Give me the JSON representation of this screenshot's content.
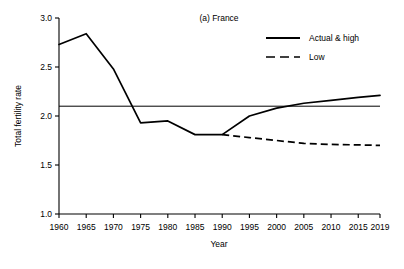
{
  "chart_data": {
    "type": "line",
    "title": "(a) France",
    "xlabel": "Year",
    "ylabel": "Total fertility rate",
    "xlim": [
      1960,
      2019
    ],
    "ylim": [
      1.0,
      3.0
    ],
    "yticks": [
      "1.0",
      "1.5",
      "2.0",
      "2.5",
      "3.0"
    ],
    "ytick_values": [
      1.0,
      1.5,
      2.0,
      2.5,
      3.0
    ],
    "xticks": [
      "1960",
      "1965",
      "1970",
      "1975",
      "1980",
      "1985",
      "1990",
      "1995",
      "2000",
      "2005",
      "2010",
      "2015",
      "2019"
    ],
    "xtick_values": [
      1960,
      1965,
      1970,
      1975,
      1980,
      1985,
      1990,
      1995,
      2000,
      2005,
      2010,
      2015,
      2019
    ],
    "grid": false,
    "legend_position": "top-right",
    "reference_line": {
      "name": "replacement-level",
      "y": 2.1,
      "style": "solid",
      "color": "#000000"
    },
    "series": [
      {
        "name": "Actual & high",
        "style": "solid",
        "color": "#000000",
        "x": [
          1960,
          1965,
          1970,
          1975,
          1980,
          1985,
          1990,
          1995,
          2000,
          2005,
          2010,
          2015,
          2019
        ],
        "values": [
          2.73,
          2.84,
          2.48,
          1.93,
          1.95,
          1.81,
          1.81,
          2.0,
          2.08,
          2.13,
          2.16,
          2.19,
          2.21
        ]
      },
      {
        "name": "Low",
        "style": "dashed",
        "color": "#000000",
        "x": [
          1990,
          1995,
          2000,
          2005,
          2010,
          2015,
          2019
        ],
        "values": [
          1.81,
          1.78,
          1.75,
          1.72,
          1.71,
          1.705,
          1.7
        ]
      }
    ]
  },
  "legend": {
    "items": [
      {
        "label": "Actual & high",
        "style": "solid"
      },
      {
        "label": "Low",
        "style": "dashed"
      }
    ]
  }
}
